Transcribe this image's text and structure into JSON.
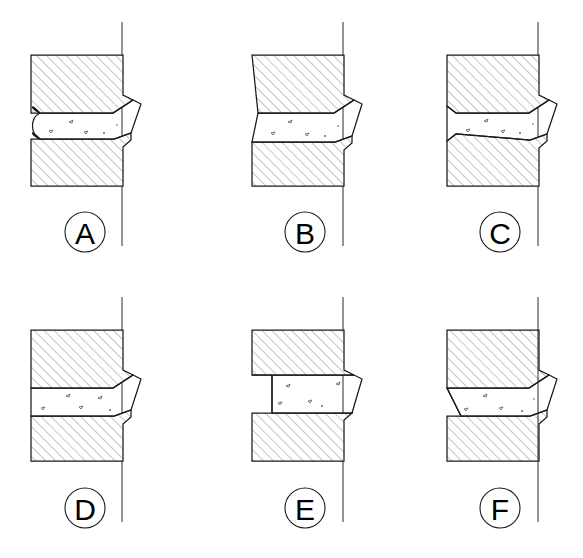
{
  "drawing": {
    "title": "Welded joint groove configurations",
    "figure_count": 6,
    "canvas": {
      "width": 583,
      "height": 558,
      "background": "#ffffff"
    },
    "colors": {
      "line": "#1a1a1a",
      "hatch": "#8a8a8a",
      "centerline": "#2a2a2a",
      "weld_fill": "#ffffff",
      "speck": "#555555",
      "background": "#ffffff"
    },
    "style": {
      "hatch_angle_degrees": 45,
      "hatch_spacing_px": 7,
      "line_width_px": 1.25,
      "callout_radius_px": 20
    }
  },
  "figures": [
    {
      "id": "A",
      "label": "A",
      "row": 1,
      "column": 1,
      "left_edge_type": "rounded-concave-groove",
      "weld_position": "flush-left",
      "weld_protrudes_right": true,
      "callout": {
        "cx": 85,
        "cy": 232,
        "r": 20
      },
      "origin": {
        "x": 31,
        "y": 55
      },
      "upper_block": {
        "x": 31,
        "y": 55,
        "width": 92,
        "height": 58
      },
      "lower_block": {
        "x": 31,
        "y": 139,
        "width": 92,
        "height": 47
      },
      "centerline": {
        "x": 122,
        "y1": 22,
        "y2": 246
      }
    },
    {
      "id": "B",
      "label": "B",
      "row": 1,
      "column": 2,
      "left_edge_type": "angled-slope",
      "weld_position": "flush-left",
      "weld_protrudes_right": true,
      "callout": {
        "cx": 305,
        "cy": 232,
        "r": 20
      },
      "origin": {
        "x": 252,
        "y": 55
      },
      "upper_block": {
        "x": 252,
        "y": 55,
        "width": 92,
        "height": 58
      },
      "lower_block": {
        "x": 252,
        "y": 139,
        "width": 92,
        "height": 47
      },
      "centerline": {
        "x": 343,
        "y1": 22,
        "y2": 246
      }
    },
    {
      "id": "C",
      "label": "C",
      "row": 1,
      "column": 3,
      "left_edge_type": "angular-v-notch",
      "weld_position": "flush-left",
      "weld_protrudes_right": true,
      "callout": {
        "cx": 500,
        "cy": 232,
        "r": 20
      },
      "origin": {
        "x": 447,
        "y": 55
      },
      "upper_block": {
        "x": 447,
        "y": 55,
        "width": 92,
        "height": 58
      },
      "lower_block": {
        "x": 447,
        "y": 139,
        "width": 92,
        "height": 47
      },
      "centerline": {
        "x": 538,
        "y1": 22,
        "y2": 246
      }
    },
    {
      "id": "D",
      "label": "D",
      "row": 2,
      "column": 1,
      "left_edge_type": "flush-vertical",
      "weld_position": "flush-left",
      "weld_protrudes_right": true,
      "callout": {
        "cx": 85,
        "cy": 508,
        "r": 20
      },
      "origin": {
        "x": 31,
        "y": 330
      },
      "upper_block": {
        "x": 31,
        "y": 330,
        "width": 92,
        "height": 58
      },
      "lower_block": {
        "x": 31,
        "y": 414,
        "width": 92,
        "height": 47
      },
      "centerline": {
        "x": 122,
        "y1": 297,
        "y2": 522
      }
    },
    {
      "id": "E",
      "label": "E",
      "row": 2,
      "column": 2,
      "left_edge_type": "recessed-weld",
      "weld_position": "inset-from-left",
      "weld_protrudes_right": true,
      "callout": {
        "cx": 305,
        "cy": 508,
        "r": 20
      },
      "origin": {
        "x": 252,
        "y": 330
      },
      "upper_block": {
        "x": 252,
        "y": 330,
        "width": 92,
        "height": 58
      },
      "lower_block": {
        "x": 252,
        "y": 414,
        "width": 92,
        "height": 47
      },
      "centerline": {
        "x": 343,
        "y1": 297,
        "y2": 522
      }
    },
    {
      "id": "F",
      "label": "F",
      "row": 2,
      "column": 3,
      "left_edge_type": "tapered-trapezoid",
      "weld_position": "flush-left",
      "weld_protrudes_right": true,
      "callout": {
        "cx": 500,
        "cy": 508,
        "r": 20
      },
      "origin": {
        "x": 447,
        "y": 330
      },
      "upper_block": {
        "x": 447,
        "y": 330,
        "width": 92,
        "height": 58
      },
      "lower_block": {
        "x": 447,
        "y": 414,
        "width": 92,
        "height": 47
      },
      "centerline": {
        "x": 538,
        "y1": 297,
        "y2": 522
      }
    }
  ]
}
